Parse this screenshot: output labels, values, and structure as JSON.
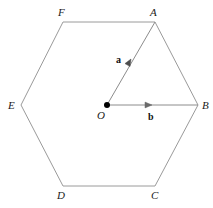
{
  "figure": {
    "canvas": {
      "width": 213,
      "height": 208,
      "background": "#ffffff"
    },
    "stroke_color": "#9a9a9a",
    "vector_stroke_color": "#8c8c8c",
    "point_color": "#000000",
    "label_color": "#1a1a1a",
    "shape": {
      "name": "hexagon",
      "vertex_order": [
        "A",
        "B",
        "C",
        "D",
        "E",
        "F"
      ],
      "points": "155,22 198,105 155,186 63,186 21,105 63,22"
    },
    "vertices": [
      {
        "id": "A",
        "label": "A",
        "x": 155,
        "y": 22,
        "label_x": 150,
        "label_y": 7
      },
      {
        "id": "B",
        "label": "B",
        "x": 198,
        "y": 105,
        "label_x": 202,
        "label_y": 100
      },
      {
        "id": "C",
        "label": "C",
        "x": 155,
        "y": 186,
        "label_x": 151,
        "label_y": 190
      },
      {
        "id": "D",
        "label": "D",
        "x": 63,
        "y": 186,
        "label_x": 57,
        "label_y": 190
      },
      {
        "id": "E",
        "label": "E",
        "x": 21,
        "y": 105,
        "label_x": 8,
        "label_y": 100
      },
      {
        "id": "F",
        "label": "F",
        "x": 63,
        "y": 22,
        "label_x": 58,
        "label_y": 7
      }
    ],
    "centre": {
      "id": "O",
      "label": "O",
      "x": 107,
      "y": 105,
      "dot_radius": 3,
      "label_x": 97,
      "label_y": 110
    },
    "vectors": [
      {
        "id": "a",
        "label": "a",
        "from": "O",
        "to": "A",
        "x1": 107,
        "y1": 105,
        "x2": 155,
        "y2": 22,
        "arrow_x": 131,
        "arrow_y": 59,
        "label_x": 116,
        "label_y": 55
      },
      {
        "id": "b",
        "label": "b",
        "from": "O",
        "to": "B",
        "x1": 107,
        "y1": 105,
        "x2": 198,
        "y2": 105,
        "arrow_x": 152,
        "arrow_y": 105,
        "label_x": 148,
        "label_y": 112
      }
    ]
  }
}
